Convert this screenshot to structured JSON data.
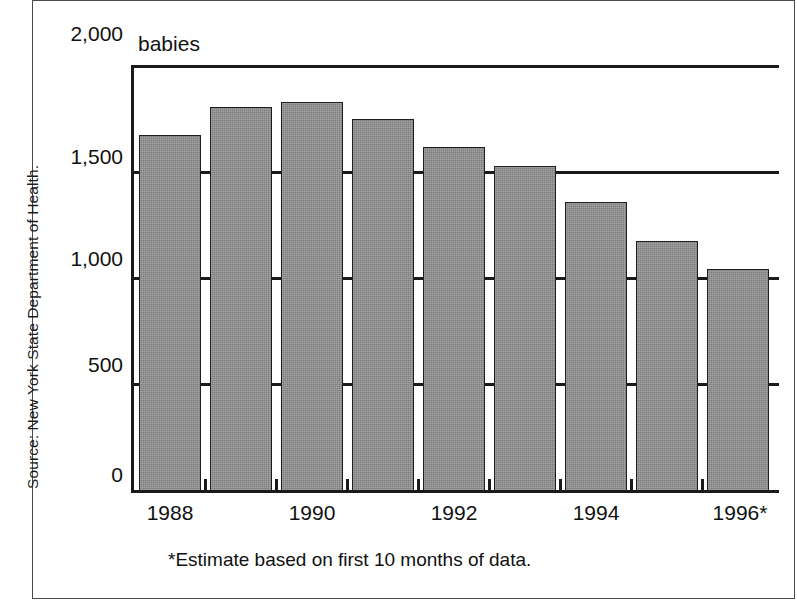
{
  "source_note": "Source: New York State Department of Health.",
  "units_label": "babies",
  "footnote": "*Estimate based on first 10 months of data.",
  "colors": {
    "bar_fill": "#7e7e7e",
    "bar_stroke": "#1f1f1f",
    "axis": "#1a1a1a",
    "text": "#111111",
    "frame": "#4a4a4a",
    "background": "#ffffff"
  },
  "axis": {
    "y_ticks": [
      "2,000",
      "1,500",
      "1,000",
      "500",
      "0"
    ],
    "y_tick_values": [
      2000,
      1500,
      1000,
      500,
      0
    ],
    "x_tick_labels": [
      "1988",
      "1990",
      "1992",
      "1994",
      "1996*"
    ]
  },
  "chart_data": {
    "type": "bar",
    "title": "",
    "subtitle": "",
    "xlabel": "",
    "ylabel": "babies",
    "categories": [
      "1988",
      "1989",
      "1990",
      "1991",
      "1992",
      "1993",
      "1994",
      "1995",
      "1996*"
    ],
    "values": [
      1670,
      1805,
      1825,
      1745,
      1615,
      1525,
      1355,
      1175,
      1040
    ],
    "ylim": [
      0,
      2000
    ],
    "ytick_step": 500,
    "grid": true,
    "grid_axis": "y",
    "legend": false,
    "legend_position": "none",
    "labeled_categories": [
      "1988",
      "1990",
      "1992",
      "1994",
      "1996*"
    ],
    "annotations": [
      "babies",
      "*Estimate based on first 10 months of data.",
      "Source: New York State Department of Health."
    ]
  }
}
